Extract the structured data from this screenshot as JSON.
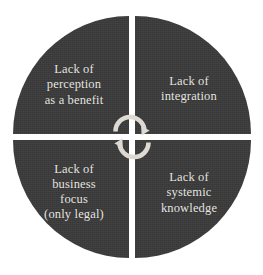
{
  "diagram": {
    "type": "quadrant-circle",
    "fill_color": "#3b3b3b",
    "text_color": "#e9e7e2",
    "background_color": "#ffffff",
    "center_icon": "cycle-arrows-icon",
    "quadrants": [
      {
        "id": "top-left",
        "position": "top-left",
        "label": "Lack of\nperception\nas a benefit"
      },
      {
        "id": "top-right",
        "position": "top-right",
        "label": "Lack of\nintegration"
      },
      {
        "id": "bottom-left",
        "position": "bottom-left",
        "label": "Lack of\nbusiness\nfocus\n(only legal)"
      },
      {
        "id": "bottom-right",
        "position": "bottom-right",
        "label": "Lack of\nsystemic\nknowledge"
      }
    ]
  }
}
